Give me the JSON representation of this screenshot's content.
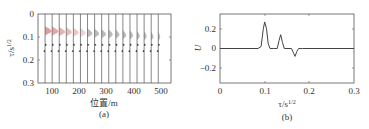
{
  "chart_data": [
    {
      "panel": "(a)",
      "type": "line",
      "title": "",
      "xlabel": "位置/m",
      "ylabel": "τ/s^1/2",
      "xlim": [
        75,
        545
      ],
      "ylim": [
        0.3,
        0
      ],
      "y_inverted": true,
      "xticks": [
        "100",
        "200",
        "300",
        "400",
        "500"
      ],
      "yticks": [
        "0",
        "0.1",
        "0.2",
        "0.3"
      ],
      "grid": false,
      "trace_positions": [
        100,
        125,
        150,
        175,
        200,
        225,
        250,
        275,
        300,
        325,
        350,
        375,
        400,
        425,
        450,
        475,
        500
      ],
      "events": [
        {
          "name": "first arrival",
          "tau_start": 0.07,
          "tau_end": 0.105,
          "trend": "moveout from 0.075 at 100 m to 0.1 at 500 m, amplitude decreasing",
          "color": "#c0504d"
        },
        {
          "name": "second event",
          "tau": 0.135
        },
        {
          "name": "third event",
          "tau": 0.16
        }
      ],
      "caption": "(a)"
    },
    {
      "panel": "(b)",
      "type": "line",
      "title": "",
      "xlabel": "τ/s^1/2",
      "ylabel": "U",
      "xlim": [
        0,
        0.3
      ],
      "ylim": [
        -0.35,
        0.35
      ],
      "xticks": [
        "0",
        "0.1",
        "0.2",
        "0.3"
      ],
      "yticks": [
        "0.2",
        "0",
        "−0.2"
      ],
      "grid": false,
      "series": [
        {
          "name": "U",
          "x": [
            0,
            0.085,
            0.092,
            0.097,
            0.1,
            0.104,
            0.108,
            0.112,
            0.12,
            0.128,
            0.132,
            0.136,
            0.14,
            0.144,
            0.15,
            0.16,
            0.165,
            0.168,
            0.172,
            0.176,
            0.185,
            0.3
          ],
          "y": [
            0,
            0,
            0.02,
            0.2,
            0.27,
            0.2,
            0.05,
            0.0,
            0.0,
            0.0,
            0.08,
            0.14,
            0.06,
            0.0,
            0.0,
            0.0,
            -0.05,
            -0.08,
            -0.03,
            0.0,
            0.0,
            0
          ]
        }
      ],
      "caption": "(b)"
    }
  ],
  "labels": {
    "a": {
      "xlabel": "位置/m",
      "ylabel_main": "τ/s",
      "ylabel_sup": "1/2",
      "caption": "(a)",
      "xticks": [
        "100",
        "200",
        "300",
        "400",
        "500"
      ],
      "yticks": [
        "0",
        "0.1",
        "0.2",
        "0.3"
      ]
    },
    "b": {
      "xlabel_main": "τ/s",
      "xlabel_sup": "1/2",
      "ylabel": "U",
      "caption": "(b)",
      "xticks": [
        "0",
        "0.1",
        "0.2",
        "0.3"
      ],
      "yticks": [
        "0.2",
        "0",
        "−0.2"
      ]
    }
  },
  "colors": {
    "axis": "#555555",
    "trace": "#444444",
    "wavelet_fill": "#c0504d"
  }
}
